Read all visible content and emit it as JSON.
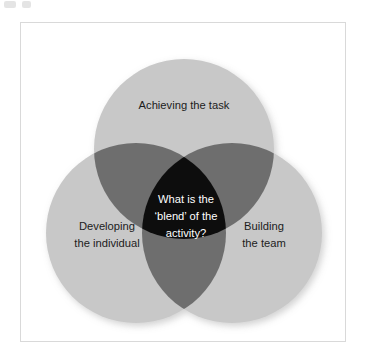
{
  "figure": {
    "kind": "venn-diagram-three-circle",
    "background_color": "#ffffff",
    "frame_border_color": "#d9d9d9"
  },
  "palette": {
    "circle_fill": "#c8c8c8",
    "pair_overlap_fill": "#6e6e6e",
    "triple_overlap_fill": "#0d0d0d",
    "lobe_text_color": "#1c1c1c",
    "center_text_color": "#ffffff"
  },
  "diagram": {
    "circles": [
      {
        "id": "achieving-the-task",
        "position": "top",
        "label": "Achieving the task",
        "label_lines": [
          "Achieving the task"
        ],
        "cx": 163,
        "cy": 126,
        "r": 90
      },
      {
        "id": "developing-the-individual",
        "position": "bottom-left",
        "label": "Developing the individual",
        "label_lines": [
          "Developing",
          "the individual"
        ],
        "cx": 115,
        "cy": 210,
        "r": 90
      },
      {
        "id": "building-the-team",
        "position": "bottom-right",
        "label": "Building the team",
        "label_lines": [
          "Building",
          "the team"
        ],
        "cx": 211,
        "cy": 210,
        "r": 90
      }
    ],
    "center": {
      "id": "blend-question",
      "label": "What is the 'blend' of the activity?",
      "label_lines": [
        "What is the",
        "‘blend’ of the",
        "activity?"
      ]
    }
  }
}
